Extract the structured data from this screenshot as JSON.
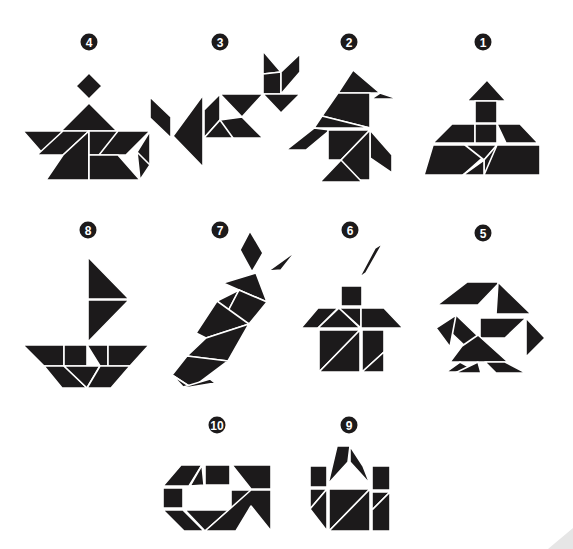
{
  "sheet": {
    "background": "#ffffff",
    "ink_color": "#1c1a1b",
    "gap_color": "#ffffff"
  },
  "figures": [
    {
      "id": "figure-4",
      "number": "4",
      "badge": {
        "cx": 89,
        "cy": 42
      },
      "subject": "person in boat",
      "pieces": [
        "89,73 102,86 89,99 76,86",
        "89,103 61,131 117,131",
        "23,131 63,131 44,155",
        "63,131 89,131 63,155 37,155",
        "89,131 63,155 46,180 89,180",
        "89,131 89,180 89,155",
        "89,131 118,131 118,155 89,155",
        "118,131 150,131 126,155 99,155",
        "89,155 118,155 140,180 89,180",
        "150,131 150,165 140,180 137,152",
        "137,152 150,165 140,180"
      ]
    },
    {
      "id": "figure-3",
      "number": "3",
      "badge": {
        "cx": 220,
        "cy": 42
      },
      "subject": "fish",
      "pieces": [
        "150,97 171,117 171,138 150,118",
        "203,95 203,167 173,136",
        "220,94 204,110 204,138 220,120",
        "220,94 263,94 242,117",
        "220,120 242,117 263,138 263,94 263,138 220,138",
        "204,138 220,120 233,138",
        "263,51 281,72 263,74",
        "263,74 281,72 281,94 263,94",
        "281,72 300,54 300,72 281,94",
        "263,94 300,94 281,113"
      ]
    },
    {
      "id": "figure-2",
      "number": "2",
      "badge": {
        "cx": 349,
        "cy": 42
      },
      "subject": "penguin / bird",
      "pieces": [
        "353,70 380,93 338,93 353,70",
        "380,93 398,99 371,99",
        "338,93 370,93 370,128 322,116",
        "322,116 370,128 314,128",
        "314,128 330,130 306,150 286,150",
        "328,130 370,130 341,160 328,160",
        "370,130 392,155 392,173 370,158",
        "341,160 370,130 370,180 342,180",
        "320,182 341,160 362,182"
      ]
    },
    {
      "id": "figure-1",
      "number": "1",
      "badge": {
        "cx": 483,
        "cy": 42
      },
      "subject": "pagoda / tower",
      "pieces": [
        "487,80 506,101 467,101",
        "475,101 497,101 497,123 475,123",
        "441,124 475,124 475,143 433,143 452,124",
        "475,124 497,124 497,143 475,143",
        "497,124 520,124 538,143 506,143",
        "433,145 497,145 463,175 424,175",
        "465,145 497,145 484,160",
        "484,160 497,145 516,145 484,175",
        "497,145 540,145 540,175 484,175",
        "463,175 484,160 484,175"
      ]
    },
    {
      "id": "figure-8",
      "number": "8",
      "badge": {
        "cx": 88,
        "cy": 230
      },
      "subject": "sailboat",
      "pieces": [
        "88,257 129,299 88,299",
        "88,300 129,300 88,342",
        "23,345 64,345 64,366 44,366",
        "64,345 87,345 87,366 64,366",
        "87,345 108,345 108,366 100,366",
        "108,345 149,345 130,366 108,366",
        "44,366 64,366 87,388 62,388",
        "64,366 100,366 87,388",
        "100,366 130,366 111,388 87,388"
      ]
    },
    {
      "id": "figure-7",
      "number": "7",
      "badge": {
        "cx": 220,
        "cy": 230
      },
      "subject": "carrot",
      "pieces": [
        "250,231 263,253 252,272 240,250",
        "268,271 296,251 281,270 256,272",
        "223,283 256,273 267,302 239,290",
        "217,301 239,290 227,313",
        "239,290 267,302 249,324 227,313",
        "196,333 217,301 249,324 206,338",
        "187,356 206,338 249,324 228,361",
        "172,375 187,356 228,361 192,388",
        "172,375 192,388 184,388",
        "180,388 210,379 215,383 185,388"
      ]
    },
    {
      "id": "figure-6",
      "number": "6",
      "badge": {
        "cx": 350,
        "cy": 230
      },
      "subject": "house with chimney smoke",
      "pieces": [
        "383,243 366,273 359,278 375,248",
        "341,286 362,286 362,306 341,306",
        "301,328 318,308 338,308 318,328",
        "318,328 339,308 360,328",
        "339,308 361,308 361,328",
        "361,308 384,308 403,328 361,328",
        "319,330 360,330 319,372",
        "319,372 360,330 360,372",
        "362,330 384,330 384,352 362,372",
        "362,372 384,352 384,372"
      ]
    },
    {
      "id": "figure-5",
      "number": "5",
      "badge": {
        "cx": 483,
        "cy": 233
      },
      "subject": "bird with spread wings",
      "pieces": [
        "467,282 500,282 478,305 437,305",
        "498,282 531,314 496,314",
        "456,315 480,338 466,347 446,328",
        "436,328 456,315 450,347",
        "480,318 526,318 505,338 480,338",
        "526,318 545,338 526,357",
        "462,346 478,335 508,362 450,362",
        "446,372 460,362 478,372",
        "455,373 478,362 481,373",
        "485,362 505,362 526,373 496,373"
      ]
    },
    {
      "id": "figure-10",
      "number": "10",
      "badge": {
        "cx": 217,
        "cy": 425
      },
      "subject": "shoe / open rectangle",
      "pieces": [
        "181,465 202,465 189,486 163,486",
        "202,465 204,485 190,486",
        "205,465 230,465 230,485 205,485",
        "232,465 271,465 271,489 251,489",
        "163,488 183,488 183,508 163,508",
        "163,510 183,510 204,531 184,531",
        "185,510 229,510 205,531",
        "231,490 251,490 251,510 231,510",
        "251,490 271,490 271,531 251,506 236,531 205,531"
      ]
    },
    {
      "id": "figure-9",
      "number": "9",
      "badge": {
        "cx": 349,
        "cy": 425
      },
      "subject": "basket / handbag",
      "pieces": [
        "337,446 350,446 348,462 328,484",
        "350,446 363,466 370,484 350,462",
        "310,466 327,466 327,487 310,487",
        "372,466 390,466 390,490 372,490",
        "310,489 327,489 310,509",
        "310,509 327,489 327,531",
        "329,489 370,489 329,531",
        "329,531 370,489 370,531",
        "372,492 390,492 372,510",
        "372,510 390,492 390,531 372,531"
      ]
    }
  ],
  "corner": {
    "shadow_visible": true
  }
}
